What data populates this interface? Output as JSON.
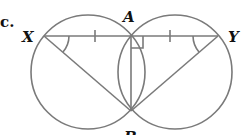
{
  "diagram": {
    "problem_marker": "c.",
    "points": {
      "X": {
        "label": "X",
        "x": 44,
        "y": 36
      },
      "A": {
        "label": "A",
        "x": 131,
        "y": 36
      },
      "Y": {
        "label": "Y",
        "x": 218,
        "y": 36
      },
      "B": {
        "label": "B",
        "x": 131,
        "y": 111
      }
    },
    "circles": [
      {
        "name": "left-circle",
        "cx": 88,
        "cy": 72,
        "r": 57
      },
      {
        "name": "right-circle",
        "cx": 175,
        "cy": 72,
        "r": 57
      }
    ],
    "segments": [
      "XY",
      "XB",
      "YB",
      "AB"
    ],
    "marks": {
      "equal_ticks": [
        "XA",
        "AY"
      ],
      "equal_angles": [
        "AXB",
        "AYB"
      ],
      "right_angle": "XAB"
    },
    "colors": {
      "line": "#7a7a7a",
      "label": "#111111"
    }
  }
}
